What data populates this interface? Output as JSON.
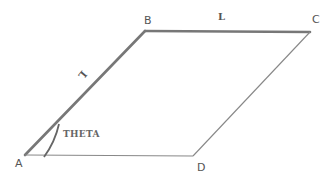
{
  "diagram": {
    "type": "parallelogram",
    "vertices": [
      {
        "id": "A",
        "label": "A",
        "x": 25,
        "y": 155
      },
      {
        "id": "B",
        "label": "B",
        "x": 145,
        "y": 31
      },
      {
        "id": "C",
        "label": "C",
        "x": 310,
        "y": 32
      },
      {
        "id": "D",
        "label": "D",
        "x": 193,
        "y": 156
      }
    ],
    "edges": [
      {
        "from": "A",
        "to": "B",
        "label": "L",
        "style": "thick"
      },
      {
        "from": "B",
        "to": "C",
        "label": "L",
        "style": "thick"
      },
      {
        "from": "C",
        "to": "D",
        "label": "",
        "style": "thin"
      },
      {
        "from": "D",
        "to": "A",
        "label": "",
        "style": "thin"
      }
    ],
    "angle": {
      "vertex": "A",
      "label": "THETA"
    },
    "colors": {
      "thick_edge": "#777777",
      "thin_edge": "#888888",
      "text": "#555555"
    }
  },
  "labels": {
    "vertex_a": "A",
    "vertex_b": "B",
    "vertex_c": "C",
    "vertex_d": "D",
    "side_ab": "L",
    "side_bc": "L",
    "angle_a": "THETA"
  }
}
